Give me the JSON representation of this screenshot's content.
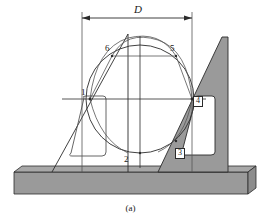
{
  "figure": {
    "caption": "(a)",
    "dimension_label": "D"
  },
  "colors": {
    "line": "#2b2b2b",
    "thin_line": "#555555",
    "shaded_fill": "#9a9a9a",
    "base_fill": "#9a9a9a",
    "background": "#ffffff",
    "label_text": "#1a1a1a"
  },
  "dimension": {
    "label": "D",
    "left_x": 82,
    "right_x": 192,
    "y": 18,
    "extension_top_y": 12,
    "extension_bottom_y": 99
  },
  "circle": {
    "cx": 140,
    "cy": 99,
    "r": 54,
    "diameter_label": "D"
  },
  "point_labels": [
    {
      "id": "1",
      "text": "1",
      "x": 81,
      "y": 88,
      "boxed": false
    },
    {
      "id": "2",
      "text": "2",
      "x": 124,
      "y": 155,
      "boxed": false
    },
    {
      "id": "3",
      "text": "3",
      "x": 176,
      "y": 150,
      "boxed": true
    },
    {
      "id": "4",
      "text": "4",
      "x": 193,
      "y": 98,
      "boxed": true
    },
    {
      "id": "5",
      "text": "5",
      "x": 170,
      "y": 44,
      "boxed": false
    },
    {
      "id": "6",
      "text": "6",
      "x": 106,
      "y": 44,
      "boxed": false
    }
  ],
  "base": {
    "top_y": 172,
    "bottom_y": 194,
    "left_x": 14,
    "right_x": 248,
    "label": "surface-plate"
  },
  "left_square": {
    "apex_x": 128,
    "apex_y": 34,
    "foot_x": 52,
    "foot_y": 172,
    "label": "left-square-tool"
  },
  "right_square": {
    "apex_x": 222,
    "apex_y": 37,
    "foot_x": 158,
    "foot_y": 172,
    "right_x": 228,
    "label": "right-square-tool-shaded"
  },
  "vertical_lines": [
    {
      "name": "left-vertical-edge",
      "x": 82,
      "y1": 12,
      "y2": 172
    },
    {
      "name": "square-stem-vertical",
      "x": 128,
      "y1": 34,
      "y2": 172
    },
    {
      "name": "circle-centerline",
      "x": 140,
      "y1": 36,
      "y2": 168
    },
    {
      "name": "right-vertical-edge",
      "x": 192,
      "y1": 12,
      "y2": 172
    }
  ],
  "horizontal_lines": [
    {
      "name": "center-horizontal-axis",
      "x1": 62,
      "y": 99,
      "x2": 206
    },
    {
      "name": "upper-chord-line",
      "x1": 112,
      "y": 56,
      "x2": 176
    }
  ]
}
